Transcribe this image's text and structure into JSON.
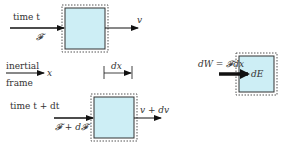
{
  "diagram": {
    "colors": {
      "box_fill": "#cdeef5",
      "box_stroke": "#333333",
      "arrow": "#111111",
      "text": "#333333"
    },
    "top_panel": {
      "time_label": "time t",
      "force_label": "𝓕",
      "velocity_label": "v"
    },
    "frame": {
      "label_line1": "inertial",
      "label_line2": "frame",
      "axis_label": "x",
      "displacement_label": "dx"
    },
    "bottom_panel": {
      "time_label": "time t + dt",
      "force_label": "𝓕 + d𝓕",
      "velocity_label": "v + dv"
    },
    "energy_panel": {
      "work_label": "dW = 𝓕dx",
      "energy_label": "dE"
    }
  }
}
